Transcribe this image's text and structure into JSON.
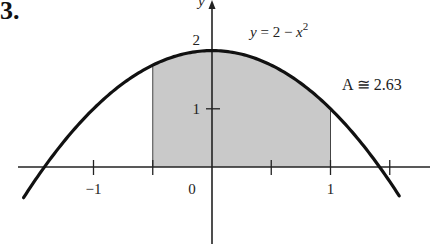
{
  "problem_number": "3.",
  "chart_data": {
    "type": "area",
    "title": "",
    "function": "y = 2 - x^2",
    "function_label": {
      "lhs": "y",
      "eq": " = 2 − ",
      "var": "x",
      "exp": "2"
    },
    "shaded_interval": [
      -0.5,
      1
    ],
    "area_label": "A ≅ 2.63",
    "area_value": 2.63,
    "xlabel": "",
    "ylabel": "y",
    "xlim": [
      -1.6,
      1.85
    ],
    "ylim": [
      -1.25,
      2.9
    ],
    "x_ticks": [
      -1,
      -0.5,
      0.5,
      1,
      1.5
    ],
    "x_tick_labels": [
      {
        "x": -1,
        "label": "−1"
      },
      {
        "x": 0,
        "label": "0"
      },
      {
        "x": 1,
        "label": "1"
      }
    ],
    "y_ticks": [
      1
    ],
    "y_tick_labels": [
      {
        "y": 1,
        "label": "1"
      },
      {
        "y": 2,
        "label": "2"
      }
    ],
    "curve_domain": [
      -1.59,
      1.58
    ],
    "grid": false,
    "colors": {
      "curve": "#111111",
      "fill": "#c9c9c9",
      "axis": "#222222"
    }
  }
}
